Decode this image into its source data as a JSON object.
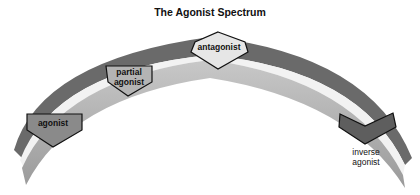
{
  "title": "The Agonist Spectrum",
  "markers": [
    {
      "id": "agonist",
      "lines": [
        "agonist"
      ],
      "fill": "#8a8a8a"
    },
    {
      "id": "partial-agonist",
      "lines": [
        "partial",
        "agonist"
      ],
      "fill": "#b4b4b4"
    },
    {
      "id": "antagonist",
      "lines": [
        "antagonist"
      ],
      "fill": "#e6e6e6"
    },
    {
      "id": "inverse-agonist",
      "lines": [
        "inverse",
        "agonist"
      ],
      "fill": "#5e5e5e"
    }
  ],
  "colors": {
    "outer_band": "#6a6a6a",
    "inner_band": "#a6a6a6",
    "highlight": "#f2f2f2",
    "outline": "#111111"
  }
}
